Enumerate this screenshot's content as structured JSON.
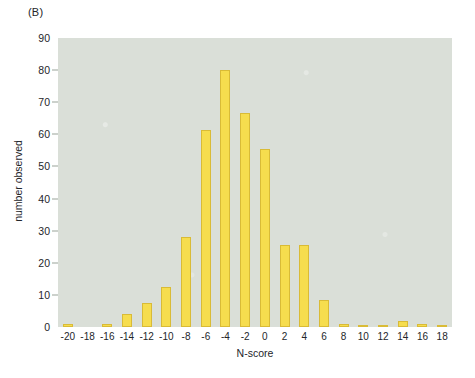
{
  "panel": {
    "label": "(B)"
  },
  "colors": {
    "bar_fill": "#f6dd4e",
    "bar_edge": "#d9bb36",
    "plot_background": "#dadfd8",
    "page_background": "#ffffff",
    "text": "#24262a"
  },
  "chart_data": {
    "type": "bar",
    "title": "(B)",
    "xlabel": "N-score",
    "ylabel": "number observed",
    "categories": [
      "-20",
      "-18",
      "-16",
      "-14",
      "-12",
      "-10",
      "-8",
      "-6",
      "-4",
      "-2",
      "0",
      "2",
      "4",
      "6",
      "8",
      "10",
      "12",
      "14",
      "16",
      "18"
    ],
    "values": [
      1,
      0,
      1,
      4,
      7.5,
      12.5,
      28,
      61.5,
      80,
      66.5,
      55.5,
      25.5,
      25.5,
      8.5,
      1,
      0.5,
      0.5,
      2,
      1,
      0.5
    ],
    "ylim": [
      0,
      90
    ],
    "yticks": [
      0,
      10,
      20,
      30,
      40,
      50,
      60,
      70,
      80,
      90
    ],
    "ytick_labels": [
      "0",
      "10",
      "20",
      "30",
      "40",
      "50",
      "60",
      "70",
      "80",
      "90"
    ],
    "xtick_labels": [
      "-20",
      "-18",
      "-16",
      "-14",
      "-12",
      "-10",
      "-8",
      "-6",
      "-4",
      "-2",
      "0",
      "2",
      "4",
      "6",
      "8",
      "10",
      "12",
      "14",
      "16",
      "18"
    ],
    "grid": false,
    "legend": null,
    "series": [
      {
        "name": "number observed",
        "values": [
          1,
          0,
          1,
          4,
          7.5,
          12.5,
          28,
          61.5,
          80,
          66.5,
          55.5,
          25.5,
          25.5,
          8.5,
          1,
          0.5,
          0.5,
          2,
          1,
          0.5
        ]
      }
    ]
  }
}
